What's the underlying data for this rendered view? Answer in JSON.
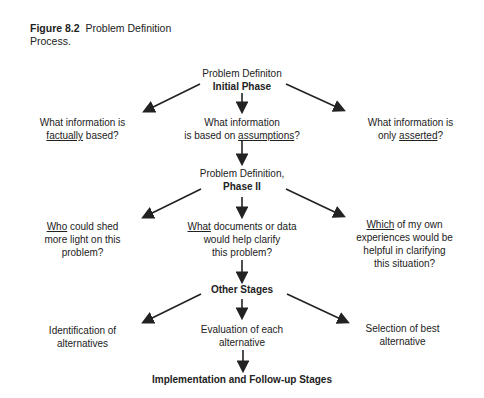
{
  "caption": {
    "label": "Figure 8.2",
    "text": "Problem Definition",
    "text2": "Process."
  },
  "phase1": {
    "line1": "Problem Definiton",
    "line2": "Initial Phase"
  },
  "q1": {
    "left": {
      "l1": "What information is",
      "u": "factually",
      "rest": " based?"
    },
    "mid": {
      "l1": "What information",
      "pre": "is based on ",
      "u": "assumptions",
      "post": "?"
    },
    "right": {
      "l1": "What information is",
      "pre": "only ",
      "u": "asserted",
      "post": "?"
    }
  },
  "phase2": {
    "line1": "Problem Definition,",
    "line2": "Phase II"
  },
  "q2": {
    "left": {
      "u": "Who",
      "rest": " could shed",
      "l2": "more light on this",
      "l3": "problem?"
    },
    "mid": {
      "u": "What",
      "rest": " documents or data",
      "l2": "would help clarify",
      "l3": "this problem?"
    },
    "right": {
      "u": "Which",
      "rest": " of my own",
      "l2": "experiences would be",
      "l3": "helpful in clarifying",
      "l4": "this situation?"
    }
  },
  "other": {
    "label": "Other Stages"
  },
  "stages": {
    "left": {
      "l1": "Identification of",
      "l2": "alternatives"
    },
    "mid": {
      "l1": "Evaluation of each",
      "l2": "alternative"
    },
    "right": {
      "l1": "Selection of best",
      "l2": "alternative"
    }
  },
  "final": {
    "label": "Implementation and Follow-up Stages"
  }
}
